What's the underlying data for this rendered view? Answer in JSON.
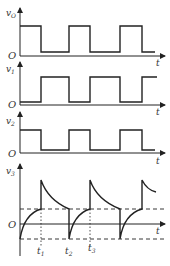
{
  "panels": [
    {
      "label": "v",
      "sub": "O",
      "axis_label": "t",
      "origin": "O"
    },
    {
      "label": "v",
      "sub": "1",
      "axis_label": "t",
      "origin": "O"
    },
    {
      "label": "v",
      "sub": "2",
      "axis_label": "t",
      "origin": "O"
    },
    {
      "label": "v",
      "sub": "3",
      "axis_label": "t",
      "origin": "O"
    }
  ],
  "time_marks": [
    {
      "label": "t",
      "sub": "1"
    },
    {
      "label": "t",
      "sub": "2"
    },
    {
      "label": "t",
      "sub": "3"
    }
  ],
  "colors": {
    "line": "#222222",
    "text": "#333333"
  }
}
